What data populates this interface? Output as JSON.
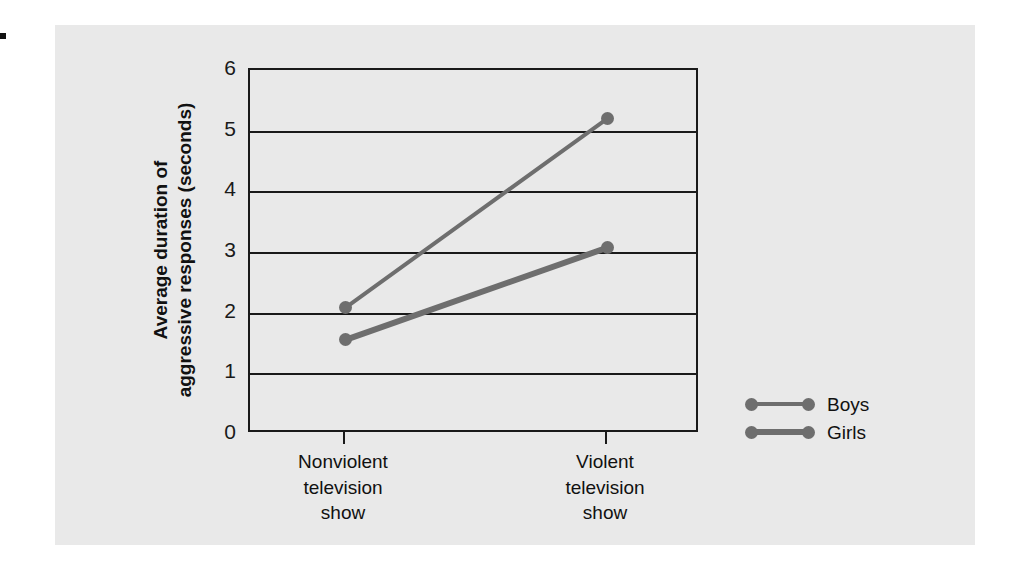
{
  "chart_data": {
    "type": "line",
    "title": "",
    "xlabel": "",
    "ylabel_line1": "Average duration of",
    "ylabel_line2": "aggressive responses (seconds)",
    "categories": [
      "Nonviolent television show",
      "Violent television show"
    ],
    "category_lines": [
      [
        "Nonviolent",
        "television",
        "show"
      ],
      [
        "Violent",
        "television",
        "show"
      ]
    ],
    "ylim": [
      0,
      6
    ],
    "yticks": [
      6,
      5,
      4,
      3,
      2,
      1,
      0
    ],
    "ytick_labels": [
      "6",
      "5",
      "4",
      "3",
      "2",
      "1",
      "0"
    ],
    "grid": true,
    "legend_position": "right",
    "series": [
      {
        "name": "Boys",
        "values": [
          2.08,
          5.2
        ],
        "color": "#6e6e6e",
        "line_width": 4
      },
      {
        "name": "Girls",
        "values": [
          1.55,
          3.07
        ],
        "color": "#6e6e6e",
        "line_width": 6
      }
    ]
  },
  "legend": {
    "entries": [
      {
        "label": "Boys"
      },
      {
        "label": "Girls"
      }
    ]
  },
  "colors": {
    "panel_background": "#e9e9e9",
    "axis": "#1a1a1a",
    "series": "#6e6e6e",
    "text": "#111111"
  }
}
